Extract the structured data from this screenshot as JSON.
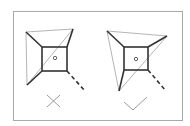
{
  "diagram": {
    "title": "",
    "colors": {
      "frame": "#a9a9a9",
      "dark_line": "#333333",
      "light_line": "#b5b5b5",
      "mark": "#999999",
      "background": "#ffffff"
    },
    "panels": [
      {
        "id": "incorrect",
        "verdict": "incorrect",
        "mark_icon": "cross-icon",
        "outer_quad": {
          "tl": [
            26,
            32
          ],
          "tr": [
            73,
            29
          ],
          "bl": [
            27,
            85
          ]
        },
        "inner_square": {
          "x": 42,
          "y": 47,
          "w": 25,
          "h": 24
        },
        "center_dot": [
          55,
          58
        ],
        "dashed_tail": {
          "from": [
            67,
            71
          ],
          "to": [
            85,
            91
          ]
        }
      },
      {
        "id": "correct",
        "verdict": "correct",
        "mark_icon": "check-icon",
        "outer_quad": {
          "tl": [
            107,
            31
          ],
          "tr": [
            167,
            36
          ],
          "bl": [
            119,
            91
          ]
        },
        "inner_square": {
          "x": 124,
          "y": 47,
          "w": 24,
          "h": 23
        },
        "center_dot": [
          136,
          59
        ],
        "dashed_tail": {
          "from": [
            148,
            70
          ],
          "to": [
            166,
            91
          ]
        }
      }
    ]
  }
}
